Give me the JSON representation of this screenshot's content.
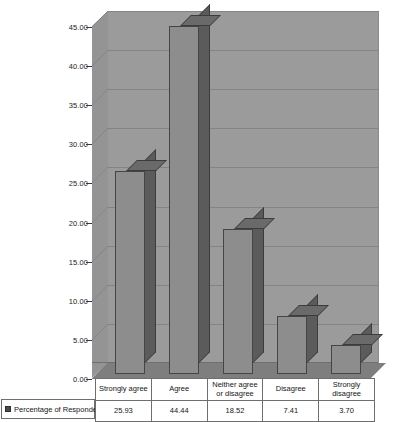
{
  "chart_data": {
    "type": "bar",
    "title": "",
    "subtitle": "",
    "xlabel": "",
    "ylabel": "",
    "categories": [
      "Strongly agree",
      "Agree",
      "Neither agree or disagree",
      "Disagree",
      "Strongly disagree"
    ],
    "values": [
      25.93,
      44.44,
      18.52,
      7.41,
      3.7
    ],
    "value_labels": [
      "25.93",
      "44.44",
      "18.52",
      "7.41",
      "3.70"
    ],
    "series": [
      {
        "name": "Percentage of Respondents",
        "values": [
          25.93,
          44.44,
          18.52,
          7.41,
          3.7
        ]
      }
    ],
    "ylim": [
      0,
      45
    ],
    "ytick_values": [
      0,
      5,
      10,
      15,
      20,
      25,
      30,
      35,
      40,
      45
    ],
    "ytick_labels": [
      "0.00",
      "5.00",
      "10.00",
      "15.00",
      "20.00",
      "25.00",
      "30.00",
      "35.00",
      "40.00",
      "45.00"
    ],
    "grid": true,
    "legend_position": "bottom-left",
    "style": "3d-column",
    "colors": {
      "bar_front": "#8d8d8d",
      "bar_side": "#5b5b5b",
      "bar_top": "#6a6a6a",
      "bar_outline": "#454545",
      "plot_wall": "#9b9b9b",
      "plot_side_wall": "#949494",
      "plot_floor": "#7e7e7e",
      "gridline": "#848484",
      "table_border": "#6e6e6e",
      "background": "#ffffff",
      "text": "#161616"
    }
  },
  "legend": {
    "series_label": "Percentage of Respondents",
    "swatch_icon": "square-swatch-icon"
  },
  "data_table": {
    "category_row": [
      "Strongly agree",
      "Agree",
      "Neither agree or disagree",
      "Disagree",
      "Strongly disagree"
    ],
    "value_row": [
      "25.93",
      "44.44",
      "18.52",
      "7.41",
      "3.70"
    ]
  }
}
